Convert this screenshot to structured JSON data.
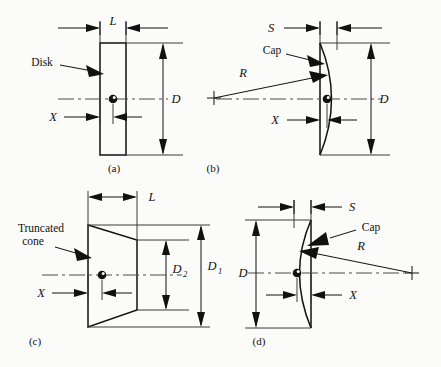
{
  "figure": {
    "title": "",
    "background_color": "#fbfbfa",
    "ink_color": "#111111"
  },
  "panels": [
    {
      "id": "a",
      "caption": "(a)",
      "shape": "disk",
      "callout": "Disk",
      "dimensions": [
        {
          "name": "L",
          "label": "L",
          "orientation": "horizontal",
          "meaning": "disk thickness"
        },
        {
          "name": "D",
          "label": "D",
          "orientation": "vertical",
          "meaning": "disk diameter"
        },
        {
          "name": "X",
          "label": "X",
          "orientation": "horizontal",
          "meaning": "offset from left face to hub center"
        }
      ]
    },
    {
      "id": "b",
      "caption": "(b)",
      "shape": "spherical-cap-bulge-right",
      "callout": "Cap",
      "dimensions": [
        {
          "name": "S",
          "label": "S",
          "orientation": "horizontal",
          "meaning": "cap height"
        },
        {
          "name": "D",
          "label": "D",
          "orientation": "vertical",
          "meaning": "cap base diameter"
        },
        {
          "name": "X",
          "label": "X",
          "orientation": "horizontal",
          "meaning": "offset to hub center"
        },
        {
          "name": "R",
          "label": "R",
          "orientation": "radial",
          "meaning": "radius of curvature"
        }
      ]
    },
    {
      "id": "c",
      "caption": "(c)",
      "shape": "truncated-cone",
      "callout": "Truncated\ncone",
      "callout_line1": "Truncated",
      "callout_line2": "cone",
      "dimensions": [
        {
          "name": "L",
          "label": "L",
          "orientation": "horizontal",
          "meaning": "cone length"
        },
        {
          "name": "D1",
          "label": "D",
          "sub": "1",
          "orientation": "vertical",
          "meaning": "large-end diameter"
        },
        {
          "name": "D2",
          "label": "D",
          "sub": "2",
          "orientation": "vertical",
          "meaning": "small-end diameter"
        },
        {
          "name": "X",
          "label": "X",
          "orientation": "horizontal",
          "meaning": "offset to hub center"
        }
      ]
    },
    {
      "id": "d",
      "caption": "(d)",
      "shape": "spherical-cap-bulge-left",
      "callout": "Cap",
      "dimensions": [
        {
          "name": "S",
          "label": "S",
          "orientation": "horizontal",
          "meaning": "cap height"
        },
        {
          "name": "D",
          "label": "D",
          "orientation": "vertical",
          "meaning": "cap base diameter"
        },
        {
          "name": "X",
          "label": "X",
          "orientation": "horizontal",
          "meaning": "offset to hub center"
        },
        {
          "name": "R",
          "label": "R",
          "orientation": "radial",
          "meaning": "radius of curvature"
        }
      ]
    }
  ],
  "labels": {
    "disk": "Disk",
    "cap_b": "Cap",
    "cap_d": "Cap",
    "truncated_line1": "Truncated",
    "truncated_line2": "cone",
    "L_a": "L",
    "D_a": "D",
    "X_a": "X",
    "S_b": "S",
    "D_b": "D",
    "X_b": "X",
    "R_b": "R",
    "L_c": "L",
    "D1_c": "D",
    "D1_c_sub": "1",
    "D2_c": "D",
    "D2_c_sub": "2",
    "X_c": "X",
    "S_d": "S",
    "D_d": "D",
    "X_d": "X",
    "R_d": "R",
    "caption_a": "(a)",
    "caption_b": "(b)",
    "caption_c": "(c)",
    "caption_d": "(d)"
  }
}
